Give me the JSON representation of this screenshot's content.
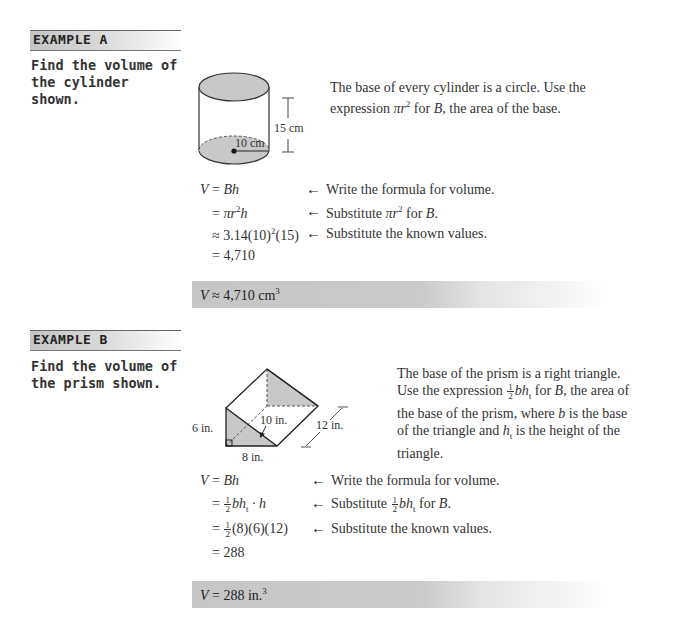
{
  "example_a": {
    "header": "EXAMPLE A",
    "prompt": "Find the volume of the cylinder shown.",
    "figure": {
      "shape": "cylinder",
      "height_label": "15 cm",
      "radius_label": "10 cm"
    },
    "description": {
      "line1": "The base of every cylinder is a circle. Use the",
      "line2_pre": "expression ",
      "line2_math": "πr",
      "line2_exp": "2",
      "line2_post_pre": " for ",
      "line2_var": "B",
      "line2_post": ", the area of the base."
    },
    "steps": [
      {
        "eq_lhs": "V",
        "eq_op": " = ",
        "eq_rhs": "Bh",
        "note": "Write the formula for volume."
      },
      {
        "eq_op": "= ",
        "eq_rhs": "πr",
        "eq_exp": "2",
        "eq_tail": "h",
        "note_pre": "Substitute ",
        "note_math": "πr",
        "note_exp": "2",
        "note_post": " for ",
        "note_var": "B",
        "note_end": "."
      },
      {
        "eq_op": "≈ ",
        "eq_rhs": "3.14(10)",
        "eq_exp": "2",
        "eq_tail": "(15)",
        "note": "Substitute the known values."
      },
      {
        "eq_op": "= ",
        "eq_rhs": "4,710"
      }
    ],
    "answer": {
      "lhs": "V",
      "op": " ≈ ",
      "value": "4,710 cm",
      "exp": "3"
    }
  },
  "example_b": {
    "header": "EXAMPLE B",
    "prompt": "Find the volume of the prism shown.",
    "figure": {
      "shape": "triangular-prism",
      "height_label": "6 in.",
      "base_label": "8 in.",
      "hypotenuse_label": "10 in.",
      "length_label": "12 in."
    },
    "description": {
      "line1": "The base of the prism is a right triangle.",
      "line2_pre": "Use the expression ",
      "frac_num": "1",
      "frac_den": "2",
      "line2_math": "bh",
      "line2_sub": "t",
      "line2_post": " for ",
      "line2_var": "B",
      "line2_end": ", the area of",
      "line3_pre": "the base of the prism, where ",
      "line3_var": "b",
      "line3_post": " is the base",
      "line4_pre": "of the triangle and ",
      "line4_var": "h",
      "line4_sub": "t",
      "line4_post": " is the height of the",
      "line5": "triangle."
    },
    "steps": [
      {
        "eq_lhs": "V",
        "eq_op": " = ",
        "eq_rhs": "Bh",
        "note": "Write the formula for volume."
      },
      {
        "eq_op": "= ",
        "frac_num": "1",
        "frac_den": "2",
        "eq_rhs": "bh",
        "eq_sub": "t",
        "eq_tail": " · h",
        "note_pre": "Substitute ",
        "note_frac_num": "1",
        "note_frac_den": "2",
        "note_math": "bh",
        "note_sub": "t",
        "note_post": " for ",
        "note_var": "B",
        "note_end": "."
      },
      {
        "eq_op": "= ",
        "frac_num": "1",
        "frac_den": "2",
        "eq_rhs": "(8)(6)(12)",
        "note": "Substitute the known values."
      },
      {
        "eq_op": "= ",
        "eq_rhs": "288"
      }
    ],
    "answer": {
      "lhs": "V",
      "op": " = ",
      "value": "288 in.",
      "exp": "3"
    }
  },
  "icons": {
    "arrow": "←"
  }
}
